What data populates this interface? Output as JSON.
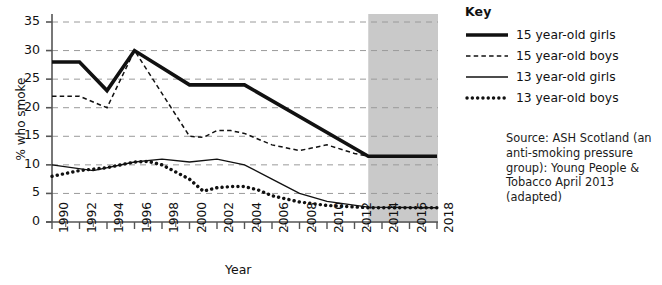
{
  "legend": {
    "title": "Key",
    "items": [
      {
        "label": "15 year-old girls",
        "style": "thick-solid",
        "color": "#111111"
      },
      {
        "label": "15 year-old boys",
        "style": "thin-dashed",
        "color": "#111111"
      },
      {
        "label": "13 year-old girls",
        "style": "thin-solid",
        "color": "#111111"
      },
      {
        "label": "13 year-old boys",
        "style": "thick-dotted",
        "color": "#111111"
      }
    ]
  },
  "source_note": "Source:  ASH Scotland (an anti-smoking pressure group): Young People & Tobacco April 2013 (adapted)",
  "colors": {
    "line": "#111111",
    "gridline": "#9a9a9a",
    "axis": "#555555",
    "projection_shade": "#c9c9c9",
    "background": "#ffffff"
  },
  "chart_data": {
    "type": "line",
    "title": "",
    "xlabel": "Year",
    "ylabel": "% who smoke",
    "xlim": [
      1990,
      2018
    ],
    "ylim": [
      0,
      35
    ],
    "yticks": [
      0,
      5,
      10,
      15,
      20,
      25,
      30,
      35
    ],
    "xticks": [
      1990,
      1992,
      1994,
      1996,
      1998,
      2000,
      2002,
      2004,
      2006,
      2008,
      2010,
      2012,
      2014,
      2016,
      2018
    ],
    "x_minor_ticks": [
      1991,
      1993,
      1995,
      1997,
      1999,
      2001,
      2003,
      2005,
      2007,
      2009,
      2011,
      2013,
      2015,
      2017
    ],
    "grid": true,
    "grid_axis": "y",
    "grid_style": "dashed",
    "legend_position": "right-outside",
    "projection_region": {
      "from": 2013,
      "to": 2018,
      "shaded": true
    },
    "series": [
      {
        "name": "15 year-old girls",
        "style": "thick-solid",
        "x": [
          1990,
          1992,
          1994,
          1996,
          2000,
          2004,
          2013,
          2018
        ],
        "values": [
          28,
          28,
          23,
          30,
          24,
          24,
          11.5,
          11.5
        ]
      },
      {
        "name": "15 year-old boys",
        "style": "thin-dashed",
        "x": [
          1990,
          1992,
          1994,
          1996,
          2000,
          2001,
          2002,
          2003,
          2004,
          2006,
          2008,
          2010,
          2012,
          2013,
          2018
        ],
        "values": [
          22,
          22,
          20,
          30,
          15,
          14.8,
          16,
          16,
          15.5,
          13.5,
          12.5,
          13.5,
          12,
          11.5,
          11.5
        ]
      },
      {
        "name": "13 year-old girls",
        "style": "thin-solid",
        "x": [
          1990,
          1993,
          1996,
          1998,
          2000,
          2002,
          2004,
          2006,
          2008,
          2010,
          2013,
          2018
        ],
        "values": [
          10,
          9,
          10.5,
          11,
          10.5,
          11,
          10,
          7.5,
          5,
          3.6,
          2.6,
          2.5
        ]
      },
      {
        "name": "13 year-old boys",
        "style": "thick-dotted",
        "x": [
          1990,
          1992,
          1994,
          1996,
          1997,
          1998,
          2000,
          2001,
          2002,
          2003,
          2004,
          2005,
          2006,
          2008,
          2010,
          2013,
          2018
        ],
        "values": [
          8,
          9,
          9.5,
          10.5,
          10.6,
          10,
          7.5,
          5.4,
          6,
          6.2,
          6.2,
          5.6,
          4.6,
          3.5,
          2.9,
          2.5,
          2.5
        ]
      }
    ]
  }
}
